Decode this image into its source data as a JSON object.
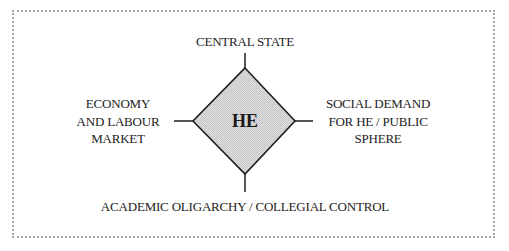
{
  "diagram": {
    "center": {
      "label": "HE",
      "shape": "diamond",
      "fill": "#d6d6d6",
      "stroke": "#1e1e1e"
    },
    "nodes": {
      "top": {
        "lines": [
          "CENTRAL STATE"
        ]
      },
      "left": {
        "lines": [
          "ECONOMY",
          "AND LABOUR",
          "MARKET"
        ]
      },
      "right": {
        "lines": [
          "SOCIAL DEMAND",
          "FOR HE / PUBLIC",
          "SPHERE"
        ]
      },
      "bottom": {
        "lines": [
          "ACADEMIC OLIGARCHY / COLLEGIAL CONTROL"
        ]
      }
    },
    "frame": {
      "border_color": "#a8a8a8",
      "style": "dotted"
    }
  }
}
